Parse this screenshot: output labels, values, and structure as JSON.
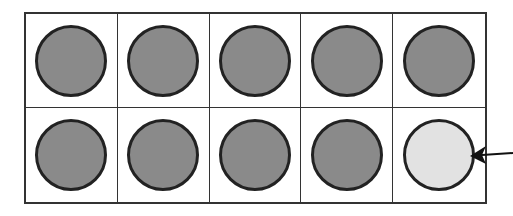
{
  "ten_frame": {
    "rows": 2,
    "columns": 5,
    "cells": [
      {
        "state": "filled"
      },
      {
        "state": "filled"
      },
      {
        "state": "filled"
      },
      {
        "state": "filled"
      },
      {
        "state": "filled"
      },
      {
        "state": "filled"
      },
      {
        "state": "filled"
      },
      {
        "state": "filled"
      },
      {
        "state": "filled"
      },
      {
        "state": "light"
      }
    ],
    "filled_count": 9,
    "light_count": 1
  },
  "colors": {
    "filled": "#8a8a8a",
    "light": "#e2e2e2",
    "outline": "#222222"
  },
  "annotation": {
    "icon": "arrow-left-icon",
    "points_to_cell": 10
  }
}
